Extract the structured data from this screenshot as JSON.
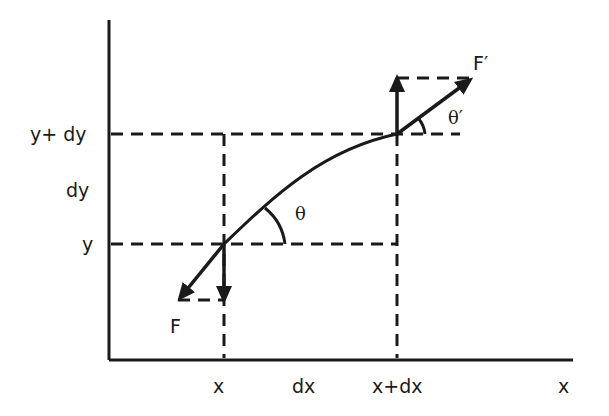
{
  "diagram": {
    "type": "string-element-force-diagram",
    "axes": {
      "x_axis_label": "x",
      "y_axis_label": ""
    },
    "x_ticks": [
      {
        "label": "x"
      },
      {
        "label": "dx"
      },
      {
        "label": "x+dx"
      }
    ],
    "y_ticks": [
      {
        "label": "y+ dy"
      },
      {
        "label": "dy"
      },
      {
        "label": "y"
      }
    ],
    "forces": [
      {
        "label": "F",
        "direction": "down-left",
        "point": "(x, y)"
      },
      {
        "label": "F′",
        "direction": "up-right",
        "point": "(x+dx, y+dy)"
      }
    ],
    "angles": [
      {
        "label": "θ",
        "at": "(x, y)"
      },
      {
        "label": "θ′",
        "at": "(x+dx, y+dy)"
      }
    ],
    "colors": {
      "line": "#1a1a1a",
      "background": "#ffffff"
    }
  }
}
